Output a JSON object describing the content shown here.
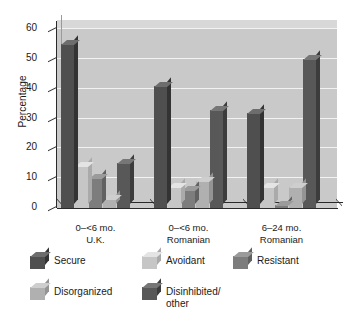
{
  "chart_data": {
    "type": "bar",
    "title": "",
    "xlabel": "",
    "ylabel": "Percentage",
    "ylim": [
      0,
      60
    ],
    "yticks": [
      0,
      10,
      20,
      30,
      40,
      50,
      60
    ],
    "grid": true,
    "grid_axis": "y",
    "legend_position": "bottom",
    "style": "3d-bars",
    "categories": [
      "0–<6 mo.\nU.K.",
      "0–<6 mo.\nRomanian",
      "6–24 mo.\nRomanian"
    ],
    "category_lines": [
      [
        "0–<6 mo.",
        "U.K."
      ],
      [
        "0–<6 mo.",
        "Romanian"
      ],
      [
        "6–24 mo.",
        "Romanian"
      ]
    ],
    "series": [
      {
        "name": "Secure",
        "color": "#4f4f4f",
        "values": [
          55,
          41,
          32
        ]
      },
      {
        "name": "Avoidant",
        "color": "#c6c6c6",
        "values": [
          14,
          7,
          7
        ]
      },
      {
        "name": "Resistant",
        "color": "#7d7d7d",
        "values": [
          10,
          6,
          1
        ]
      },
      {
        "name": "Disorganized",
        "color": "#b0b0b0",
        "values": [
          3,
          9,
          7
        ]
      },
      {
        "name": "Disinhibited/\nother",
        "color": "#585858",
        "values": [
          15,
          33,
          50
        ]
      }
    ]
  },
  "legend": {
    "items": [
      {
        "label": "Secure"
      },
      {
        "label": "Avoidant"
      },
      {
        "label": "Resistant"
      },
      {
        "label": "Disorganized"
      },
      {
        "label": "Disinhibited/\nother"
      }
    ]
  },
  "colors": {
    "plot_background": "#c9c9c9",
    "plot_top_face": "#d8d8d8",
    "gridline": "#f2f2f2",
    "axis": "#2a2a2a",
    "page_background": "#ffffff",
    "text": "#1a1a1a"
  }
}
